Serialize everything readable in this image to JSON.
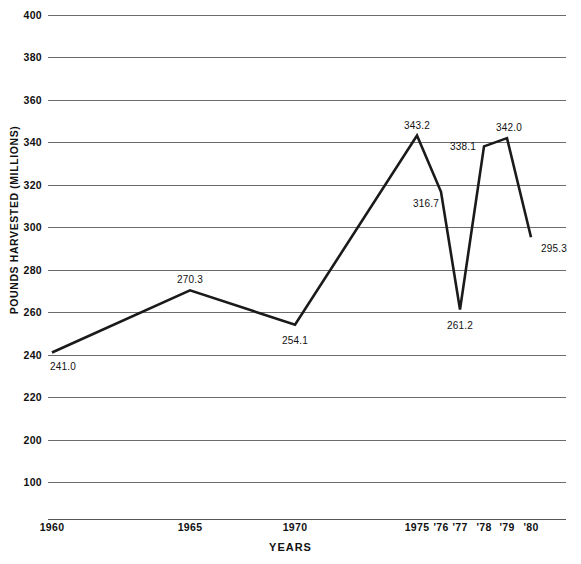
{
  "chart_data": {
    "type": "line",
    "title": "",
    "xlabel": "YEARS",
    "ylabel": "POUNDS HARVESTED (MILLIONS)",
    "x": [
      "1960",
      "1965",
      "1970",
      "1975",
      "'76",
      "'77",
      "'78",
      "'79",
      "'80"
    ],
    "categories": [
      "1960",
      "1965",
      "1970",
      "1975",
      "'76",
      "'77",
      "'78",
      "'79",
      "'80"
    ],
    "values": [
      241.0,
      270.3,
      254.1,
      343.2,
      316.7,
      261.2,
      338.1,
      342.0,
      295.3
    ],
    "point_labels": [
      "241.0",
      "270.3",
      "254.1",
      "343.2",
      "316.7",
      "261.2",
      "338.1",
      "342.0",
      "295.3"
    ],
    "ylim": [
      180,
      400
    ],
    "yticks": [
      400,
      380,
      360,
      340,
      320,
      300,
      280,
      260,
      240,
      220,
      200,
      180
    ],
    "ytick_labels": [
      "400",
      "380",
      "360",
      "340",
      "320",
      "300",
      "280",
      "260",
      "240",
      "220",
      "200",
      "100"
    ],
    "grid": true,
    "legend": "none",
    "line_color": "#1a1a1a",
    "grid_color": "#6b6b6b",
    "background": "#ffffff"
  },
  "axes": {
    "y_title": "POUNDS HARVESTED (MILLIONS)",
    "x_title": "YEARS"
  }
}
